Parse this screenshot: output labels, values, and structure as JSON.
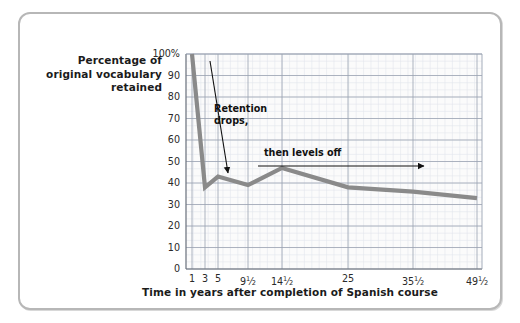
{
  "figure": {
    "frame_color": "#b7b7b7",
    "background": "#ffffff"
  },
  "chart_data": {
    "type": "line",
    "title": "",
    "ylabel": "Percentage of original vocabulary retained",
    "xlabel": "Time in years after completion of Spanish course",
    "ylabel_lines": [
      "Percentage of",
      "original vocabulary",
      "retained"
    ],
    "series": [
      {
        "name": "Vocabulary retained",
        "color": "#8a8a8a",
        "x": [
          1,
          3,
          5,
          9.5,
          14.5,
          25,
          35.5,
          49.5
        ],
        "values": [
          100,
          38,
          43,
          39,
          47,
          38,
          36,
          33
        ]
      }
    ],
    "x_categories": [
      "1",
      "3",
      "5",
      "9½",
      "14½",
      "25",
      "35½",
      "49½"
    ],
    "xtick_labels": [
      {
        "whole": "1",
        "num": "",
        "den": ""
      },
      {
        "whole": "3",
        "num": "",
        "den": ""
      },
      {
        "whole": "5",
        "num": "",
        "den": ""
      },
      {
        "whole": "9",
        "num": "1",
        "den": "2"
      },
      {
        "whole": "14",
        "num": "1",
        "den": "2"
      },
      {
        "whole": "25",
        "num": "",
        "den": ""
      },
      {
        "whole": "35",
        "num": "1",
        "den": "2"
      },
      {
        "whole": "49",
        "num": "1",
        "den": "2"
      }
    ],
    "ytick_labels": [
      "100%",
      "90",
      "80",
      "70",
      "60",
      "50",
      "40",
      "30",
      "20",
      "10",
      "0"
    ],
    "ytick_values": [
      100,
      90,
      80,
      70,
      60,
      50,
      40,
      30,
      20,
      10,
      0
    ],
    "ylim": [
      0,
      100
    ],
    "xlim": [
      0,
      52
    ],
    "grid": true,
    "grid_color": "#9aa2b1",
    "minor_grid": true,
    "legend": "none",
    "annotations": [
      {
        "id": "retention-drops",
        "text_lines": [
          "Retention",
          "drops,"
        ],
        "arrow": "diagonal-down-left"
      },
      {
        "id": "then-levels-off",
        "text_lines": [
          "then levels off"
        ],
        "arrow": "horizontal-right"
      }
    ]
  },
  "annotations": {
    "retention_drops_line1": "Retention",
    "retention_drops_line2": "drops,",
    "then_levels_off": "then levels off"
  }
}
